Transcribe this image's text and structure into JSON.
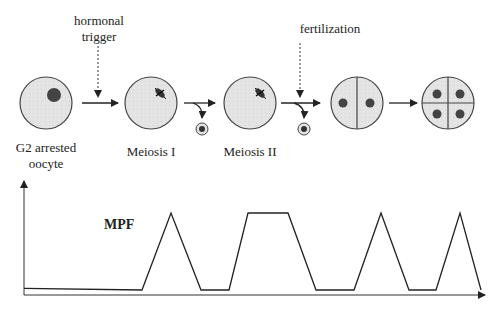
{
  "diagram": {
    "stages": [
      {
        "id": "g2",
        "label_line1": "G2 arrested",
        "label_line2": "oocyte"
      },
      {
        "id": "meiosis1",
        "label": "Meiosis I"
      },
      {
        "id": "meiosis2",
        "label": "Meiosis II"
      },
      {
        "id": "two-cell",
        "label": ""
      },
      {
        "id": "four-cell",
        "label": ""
      }
    ],
    "triggers": {
      "hormonal_line1": "hormonal",
      "hormonal_line2": "trigger",
      "fertilization": "fertilization"
    },
    "colors": {
      "cell_fill": "#e4e4e4",
      "nucleus": "#444444",
      "line": "#222222"
    }
  },
  "chart_data": {
    "type": "line",
    "title": "",
    "series_label": "MPF",
    "xlabel": "",
    "ylabel": "",
    "grid": false,
    "x": [
      0,
      118,
      147,
      177,
      205,
      224,
      264,
      292,
      330,
      357,
      385,
      412,
      436,
      457
    ],
    "values": [
      0.02,
      0.0,
      1.0,
      0.0,
      0.0,
      1.0,
      1.0,
      0.0,
      0.0,
      1.0,
      0.0,
      0.0,
      1.0,
      0.0
    ]
  }
}
